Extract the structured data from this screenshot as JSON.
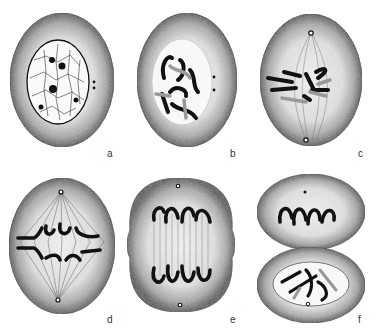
{
  "figure": {
    "panels": [
      {
        "id": "a",
        "label": "a",
        "stage": "interphase"
      },
      {
        "id": "b",
        "label": "b",
        "stage": "prophase"
      },
      {
        "id": "c",
        "label": "c",
        "stage": "prometaphase"
      },
      {
        "id": "d",
        "label": "d",
        "stage": "metaphase"
      },
      {
        "id": "e",
        "label": "e",
        "stage": "anaphase"
      },
      {
        "id": "f",
        "label": "f",
        "stage": "telophase"
      }
    ]
  },
  "colors": {
    "background": "#ffffff",
    "cytoplasm_center": "#f4f4f4",
    "cytoplasm_edge": "#5a5a5a",
    "outline": "#222222",
    "chromosome": "#111111",
    "chromatid_light": "#9a9a9a",
    "spindle": "#555555"
  }
}
